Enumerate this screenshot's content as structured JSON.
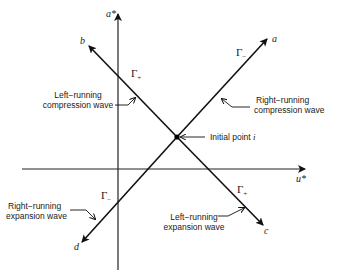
{
  "diagram": {
    "axes": {
      "vertical": {
        "label": "a*"
      },
      "horizontal": {
        "label": "u*"
      }
    },
    "lines": [
      {
        "id": "a",
        "label": "a",
        "characteristic": "Γ",
        "sign": "−"
      },
      {
        "id": "b",
        "label": "b",
        "characteristic": "Γ",
        "sign": "+"
      },
      {
        "id": "c",
        "label": "c",
        "characteristic": "Γ",
        "sign": "+"
      },
      {
        "id": "d",
        "label": "d",
        "characteristic": "Γ",
        "sign": "−"
      }
    ],
    "annotations": {
      "left_compression_line1": "Left−running",
      "left_compression_line2": "compression wave",
      "right_compression_line1": "Right−running",
      "right_compression_line2": "compression wave",
      "initial_point": "Initial point",
      "initial_point_symbol": "i",
      "right_expansion_line1": "Right−running",
      "right_expansion_line2": "expansion wave",
      "left_expansion_line1": "Left−running",
      "left_expansion_line2": "expansion wave"
    },
    "gamma_labels": {
      "upper_left": {
        "base": "Γ",
        "sub": "+"
      },
      "upper_right": {
        "base": "Γ",
        "sub": "−"
      },
      "lower_left": {
        "base": "Γ",
        "sub": "−"
      },
      "lower_right": {
        "base": "Γ",
        "sub": "+"
      }
    }
  }
}
